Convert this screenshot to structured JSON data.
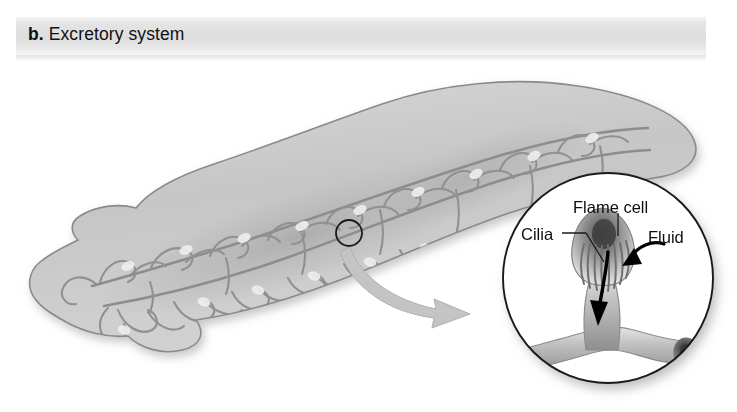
{
  "figure": {
    "panel_letter": "b.",
    "panel_title": "Excretory system",
    "background_color": "#ffffff",
    "header_band_color": "#e2e2e2",
    "ink_color": "#0d0d0d"
  },
  "organism": {
    "name": "planarian-flatworm",
    "body_fill": "#c9c9c9",
    "body_outline": "#7b7b7b",
    "tubule_color": "#8e8e8e",
    "marker": {
      "name": "magnified-region-marker",
      "cx": 349,
      "cy": 233,
      "r": 13
    }
  },
  "connector_arrow": {
    "name": "magnification-arrow",
    "color": "#bdbdbd",
    "from_x": 349,
    "from_y": 246,
    "to_x": 489,
    "to_y": 312
  },
  "inset": {
    "name": "flame-cell-detail",
    "circle": {
      "cx": 608,
      "cy": 278,
      "r": 106
    },
    "outline_color": "#1a1a1a",
    "labels": [
      {
        "id": "flame-cell",
        "text": "Flame cell"
      },
      {
        "id": "cilia",
        "text": "Cilia"
      },
      {
        "id": "fluid",
        "text": "Fluid"
      }
    ],
    "arrows": [
      {
        "id": "fluid-arrow",
        "color": "#000000",
        "direction": "down-left"
      },
      {
        "id": "flow-arrow",
        "color": "#000000",
        "direction": "down"
      }
    ],
    "leaders": [
      {
        "id": "flame-cell-leader"
      },
      {
        "id": "cilia-leader"
      }
    ]
  }
}
